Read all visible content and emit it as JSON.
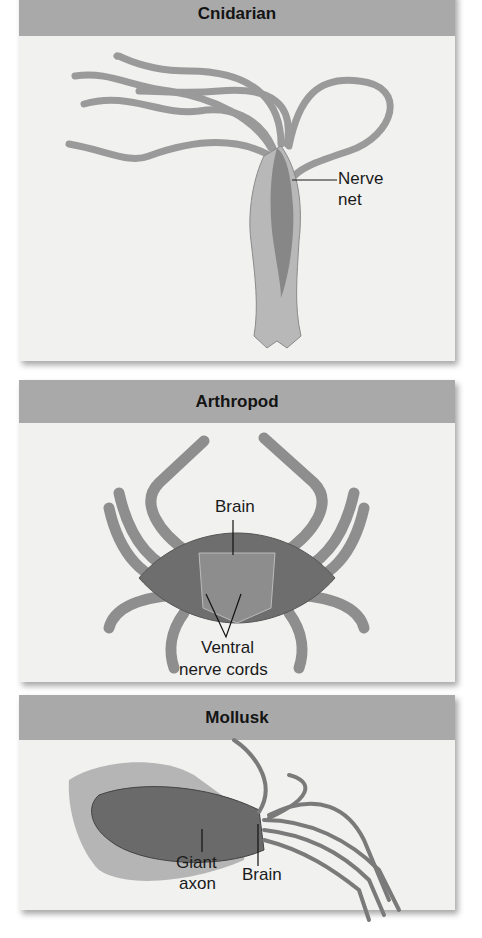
{
  "panels": [
    {
      "title": "Cnidarian",
      "labels": [
        "Nerve",
        "net"
      ]
    },
    {
      "title": "Arthropod",
      "labels": [
        "Brain",
        "Ventral",
        "nerve cords"
      ]
    },
    {
      "title": "Mollusk",
      "labels": [
        "Giant",
        "axon",
        "Brain"
      ]
    }
  ],
  "colors": {
    "header_bg": "#a9a9a9",
    "panel_bg": "#f1f1f0",
    "illustration": "#8a8a8a",
    "text": "#141414"
  }
}
